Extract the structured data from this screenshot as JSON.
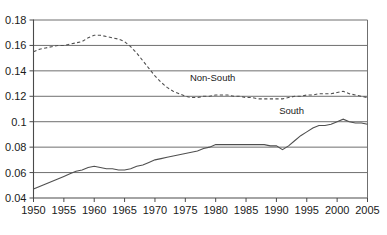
{
  "chart_data": {
    "type": "line",
    "title": "",
    "subtitle": "",
    "xlabel": "",
    "ylabel": "",
    "xlim": [
      1950,
      2005
    ],
    "ylim": [
      0.04,
      0.18
    ],
    "grid": true,
    "grid_axis": "y",
    "legend": "inline-annotations",
    "x_ticks": [
      "1950",
      "1955",
      "1960",
      "1965",
      "1970",
      "1975",
      "1980",
      "1985",
      "1990",
      "1995",
      "2000",
      "2005"
    ],
    "y_ticks": [
      "0.04",
      "0.06",
      "0.08",
      "0.1",
      "0.12",
      "0.14",
      "0.16",
      "0.18"
    ],
    "x": [
      1950,
      1951,
      1952,
      1953,
      1954,
      1955,
      1956,
      1957,
      1958,
      1959,
      1960,
      1961,
      1962,
      1963,
      1964,
      1965,
      1966,
      1967,
      1968,
      1969,
      1970,
      1971,
      1972,
      1973,
      1974,
      1975,
      1976,
      1977,
      1978,
      1979,
      1980,
      1981,
      1982,
      1983,
      1984,
      1985,
      1986,
      1987,
      1988,
      1989,
      1990,
      1991,
      1992,
      1993,
      1994,
      1995,
      1996,
      1997,
      1998,
      1999,
      2000,
      2001,
      2002,
      2003,
      2004,
      2005
    ],
    "series": [
      {
        "name": "Non-South",
        "style": "dashed",
        "color": "#4f4f4f",
        "annotation": "Non-South",
        "values": [
          0.155,
          0.157,
          0.158,
          0.159,
          0.16,
          0.16,
          0.161,
          0.162,
          0.163,
          0.166,
          0.168,
          0.168,
          0.167,
          0.166,
          0.165,
          0.163,
          0.159,
          0.154,
          0.148,
          0.142,
          0.136,
          0.131,
          0.127,
          0.124,
          0.122,
          0.12,
          0.119,
          0.119,
          0.12,
          0.12,
          0.121,
          0.121,
          0.121,
          0.12,
          0.12,
          0.119,
          0.119,
          0.118,
          0.118,
          0.118,
          0.118,
          0.118,
          0.119,
          0.12,
          0.12,
          0.121,
          0.121,
          0.122,
          0.122,
          0.122,
          0.123,
          0.124,
          0.122,
          0.121,
          0.12,
          0.119
        ]
      },
      {
        "name": "South",
        "style": "solid",
        "color": "#4f4f4f",
        "annotation": "South",
        "values": [
          0.047,
          0.049,
          0.051,
          0.053,
          0.055,
          0.057,
          0.059,
          0.061,
          0.062,
          0.064,
          0.065,
          0.064,
          0.063,
          0.063,
          0.062,
          0.062,
          0.063,
          0.065,
          0.066,
          0.068,
          0.07,
          0.071,
          0.072,
          0.073,
          0.074,
          0.075,
          0.076,
          0.077,
          0.079,
          0.08,
          0.082,
          0.082,
          0.082,
          0.082,
          0.082,
          0.082,
          0.082,
          0.082,
          0.082,
          0.081,
          0.081,
          0.078,
          0.081,
          0.085,
          0.089,
          0.092,
          0.095,
          0.097,
          0.097,
          0.098,
          0.1,
          0.102,
          0.1,
          0.099,
          0.099,
          0.098
        ]
      }
    ],
    "annotations": [
      {
        "text": "Non-South",
        "x": 1979.5,
        "y": 0.132
      },
      {
        "text": "South",
        "x": 1992.5,
        "y": 0.106
      }
    ],
    "colors": {
      "line": "#4f4f4f",
      "grid": "#6f6f6f",
      "axis": "#4a4a4a",
      "text": "#1a1a1a",
      "background": "#ffffff"
    }
  }
}
